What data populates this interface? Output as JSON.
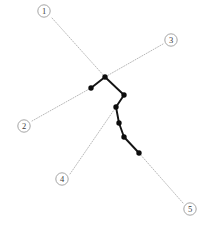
{
  "figure": {
    "width": 209,
    "height": 230,
    "background_color": "#ffffff",
    "title": "",
    "caption": ""
  },
  "style": {
    "leader_color": "#9a9a9a",
    "chain_color": "#141414",
    "node_color": "#0d0d0d",
    "callout_ring_color": "#8e8e8e",
    "callout_text_color": "#3a3a3a"
  },
  "chart_data": {
    "type": "scatter",
    "title": "",
    "xlabel": "",
    "ylabel": "",
    "xlim": [
      0,
      209
    ],
    "ylim": [
      230,
      0
    ],
    "grid": false,
    "legend": "none",
    "series": [
      {
        "name": "node-chain",
        "marker": "filled-circle",
        "connected": true,
        "points": [
          {
            "id": "n1",
            "x": 91,
            "y": 88
          },
          {
            "id": "n2",
            "x": 105,
            "y": 77
          },
          {
            "id": "n3",
            "x": 124,
            "y": 95
          },
          {
            "id": "n4",
            "x": 116,
            "y": 107
          },
          {
            "id": "n5",
            "x": 119,
            "y": 123
          },
          {
            "id": "n6",
            "x": 124,
            "y": 137
          },
          {
            "id": "n7",
            "x": 139,
            "y": 153
          }
        ]
      }
    ],
    "annotations": [
      {
        "label": "1",
        "glyph": "①",
        "callout_x": 44,
        "callout_y": 11,
        "leader_from_x": 52,
        "leader_from_y": 18,
        "leader_to_x": 105,
        "leader_to_y": 77,
        "target_node": "n2"
      },
      {
        "label": "2",
        "glyph": "②",
        "callout_x": 24,
        "callout_y": 126,
        "leader_from_x": 32,
        "leader_from_y": 121,
        "leader_to_x": 91,
        "leader_to_y": 88,
        "target_node": "n1"
      },
      {
        "label": "3",
        "glyph": "③",
        "callout_x": 171,
        "callout_y": 40,
        "leader_from_x": 163,
        "leader_from_y": 44,
        "leader_to_x": 105,
        "leader_to_y": 77,
        "target_node": "n2"
      },
      {
        "label": "4",
        "glyph": "④",
        "callout_x": 62,
        "callout_y": 179,
        "leader_from_x": 70,
        "leader_from_y": 174,
        "leader_to_x": 116,
        "leader_to_y": 107,
        "target_node": "n4"
      },
      {
        "label": "5",
        "glyph": "⑤",
        "callout_x": 190,
        "callout_y": 209,
        "leader_from_x": 183,
        "leader_from_y": 203,
        "leader_to_x": 139,
        "leader_to_y": 153,
        "target_node": "n7"
      }
    ]
  }
}
